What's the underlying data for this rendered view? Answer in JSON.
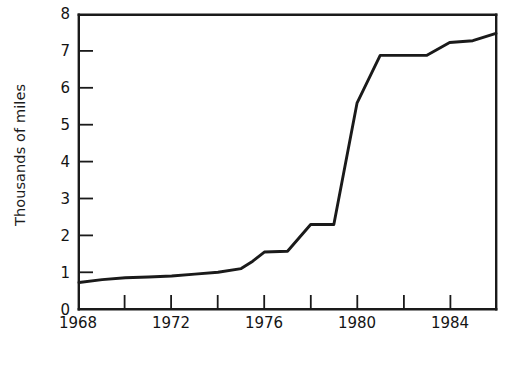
{
  "chart": {
    "title": "",
    "ylabel": "Thousands of miles",
    "xlabel": "",
    "ytick_labels": [
      "0",
      "1",
      "2",
      "3",
      "4",
      "5",
      "6",
      "7",
      "8"
    ],
    "xtick_labels": [
      "1968",
      "1972",
      "1976",
      "1980",
      "1984"
    ],
    "line_color": "#1a1a1a",
    "axis_color": "#1a1a1a",
    "background_color": "#ffffff"
  },
  "chart_data": {
    "type": "line",
    "title": "",
    "xlabel": "",
    "ylabel": "Thousands of miles",
    "xlim": [
      1968,
      1986
    ],
    "ylim": [
      0,
      8
    ],
    "xticks": [
      1968,
      1970,
      1972,
      1974,
      1976,
      1978,
      1980,
      1982,
      1984,
      1986
    ],
    "xticklabels": [
      "1968",
      "",
      "1972",
      "",
      "1976",
      "",
      "1980",
      "",
      "1984",
      ""
    ],
    "yticks": [
      0,
      1,
      2,
      3,
      4,
      5,
      6,
      7,
      8
    ],
    "yticklabels": [
      "0",
      "1",
      "2",
      "3",
      "4",
      "5",
      "6",
      "7",
      "8"
    ],
    "grid": false,
    "legend": false,
    "series": [
      {
        "name": "Thousands of miles",
        "x": [
          1968,
          1969,
          1970,
          1971,
          1972,
          1973,
          1974,
          1975,
          1975.5,
          1976,
          1977,
          1978,
          1979,
          1980,
          1981,
          1982,
          1983,
          1984,
          1985,
          1986
        ],
        "y": [
          0.72,
          0.8,
          0.85,
          0.87,
          0.9,
          0.95,
          1.0,
          1.1,
          1.3,
          1.55,
          1.57,
          2.3,
          2.3,
          5.6,
          6.9,
          6.9,
          6.9,
          7.25,
          7.3,
          7.5
        ]
      }
    ]
  }
}
